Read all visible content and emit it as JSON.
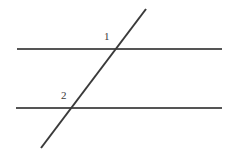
{
  "figure": {
    "width": 236,
    "height": 154,
    "background_color": "#ffffff",
    "line_color": "#555555",
    "transversal_color": "#3a3a3a",
    "label_color": "#3c3c3c"
  },
  "labels": {
    "angle_1": "1",
    "angle_2": "2"
  },
  "chart_data": {
    "type": "diagram",
    "elements": [
      {
        "name": "top-parallel-line",
        "kind": "line",
        "x1": 17,
        "y1": 49,
        "x2": 222,
        "y2": 49,
        "stroke": "#555555",
        "stroke_width": 2
      },
      {
        "name": "bottom-parallel-line",
        "kind": "line",
        "x1": 16,
        "y1": 108,
        "x2": 222,
        "y2": 108,
        "stroke": "#555555",
        "stroke_width": 2
      },
      {
        "name": "transversal-line",
        "kind": "line",
        "x1": 146,
        "y1": 9,
        "x2": 41,
        "y2": 148,
        "stroke": "#3a3a3a",
        "stroke_width": 2
      }
    ],
    "intersections": [
      {
        "name": "upper-intersection",
        "x": 116,
        "y": 49,
        "label": "1"
      },
      {
        "name": "lower-intersection",
        "x": 72,
        "y": 108,
        "label": "2"
      }
    ],
    "annotations": [
      {
        "name": "angle-label-1",
        "text": "1",
        "x": 108,
        "y": 38
      },
      {
        "name": "angle-label-2",
        "text": "2",
        "x": 65,
        "y": 97
      }
    ]
  }
}
